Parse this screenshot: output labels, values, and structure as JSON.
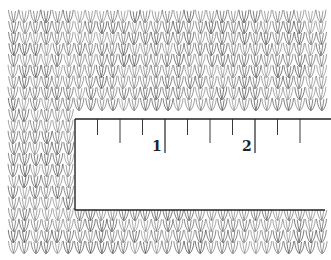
{
  "figure": {
    "colors": {
      "ink": "#333333",
      "background": "#ffffff"
    }
  },
  "ruler": {
    "labels": [
      "1",
      "2"
    ],
    "ticks_per_unit": 4,
    "units_shown": 2.5
  }
}
